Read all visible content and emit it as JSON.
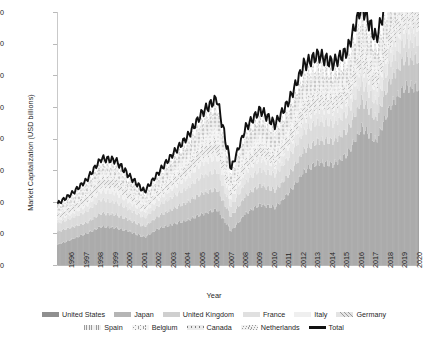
{
  "chart_data": {
    "type": "area",
    "title": "",
    "xlabel": "Year",
    "ylabel": "Market Capitalization (USD billions)",
    "ylim": [
      0,
      40000
    ],
    "ytick_labels": [
      "40,000",
      "35,000",
      "30,000",
      "25,000",
      "20,000",
      "15,000",
      "10,000",
      "5,000",
      "0"
    ],
    "ytick_values": [
      40000,
      35000,
      30000,
      25000,
      20000,
      15000,
      10000,
      5000,
      0
    ],
    "grid": false,
    "legend_position": "bottom",
    "categories": [
      "1996",
      "1997",
      "1998",
      "1999",
      "2000",
      "2001",
      "2002",
      "2003",
      "2004",
      "2005",
      "2006",
      "2007",
      "2008",
      "2009",
      "2010",
      "2011",
      "2012",
      "2013",
      "2014",
      "2015",
      "2016",
      "2017",
      "2018",
      "2019",
      "2020"
    ],
    "stacked": true,
    "series": [
      {
        "name": "United States",
        "fill": "#9d9d9d",
        "pattern": "vertical-lines",
        "values": [
          3200,
          4100,
          5000,
          6100,
          5900,
          5300,
          4400,
          5800,
          6500,
          7100,
          8100,
          8800,
          5400,
          8200,
          9600,
          9100,
          11500,
          14800,
          16300,
          15900,
          17500,
          21800,
          19600,
          25300,
          28200
        ]
      },
      {
        "name": "Japan",
        "fill": "#bdbdbd",
        "pattern": "solid",
        "values": [
          2100,
          1900,
          1700,
          2100,
          2100,
          1800,
          1700,
          2000,
          2400,
          2900,
          3300,
          3200,
          2300,
          2800,
          3100,
          2700,
          2900,
          3300,
          3400,
          3700,
          3800,
          4300,
          3500,
          4200,
          4500
        ]
      },
      {
        "name": "United Kingdom",
        "fill": "#d6d6d6",
        "pattern": "solid",
        "values": [
          1300,
          1500,
          1800,
          2200,
          2000,
          1700,
          1400,
          1700,
          2000,
          2300,
          2800,
          2900,
          1600,
          2200,
          2500,
          2500,
          2800,
          3000,
          3100,
          2800,
          2700,
          2900,
          2600,
          2800,
          2800
        ]
      },
      {
        "name": "France",
        "fill": "#e3e3e3",
        "pattern": "solid",
        "values": [
          530,
          640,
          900,
          1300,
          1400,
          1100,
          900,
          1000,
          1300,
          1600,
          2000,
          2100,
          1200,
          1600,
          1700,
          1400,
          1600,
          1900,
          2000,
          2000,
          1900,
          2300,
          2100,
          2300,
          2300
        ]
      },
      {
        "name": "Italy",
        "fill": "#efefef",
        "pattern": "solid",
        "values": [
          250,
          330,
          550,
          700,
          800,
          500,
          400,
          500,
          600,
          700,
          900,
          900,
          500,
          600,
          600,
          400,
          500,
          600,
          600,
          500,
          500,
          600,
          500,
          600,
          600
        ]
      },
      {
        "name": "Germany",
        "fill": "#e8e8e8",
        "pattern": "hatch",
        "values": [
          600,
          800,
          1000,
          1400,
          1300,
          1000,
          600,
          800,
          1000,
          1200,
          1600,
          1800,
          1000,
          1300,
          1400,
          1200,
          1400,
          1900,
          1700,
          1700,
          1700,
          2200,
          1800,
          2000,
          2200
        ]
      },
      {
        "name": "Spain",
        "fill": "#f2f2f2",
        "pattern": "dots",
        "values": [
          200,
          280,
          400,
          500,
          500,
          470,
          450,
          600,
          900,
          1000,
          1300,
          1800,
          900,
          1300,
          1200,
          1000,
          1000,
          1100,
          1000,
          800,
          800,
          900,
          700,
          800,
          700
        ]
      },
      {
        "name": "Belgium",
        "fill": "#f6f6f6",
        "pattern": "circles",
        "values": [
          120,
          140,
          250,
          200,
          200,
          160,
          130,
          180,
          250,
          300,
          400,
          400,
          200,
          300,
          300,
          230,
          300,
          350,
          400,
          400,
          400,
          450,
          350,
          400,
          400
        ]
      },
      {
        "name": "Canada",
        "fill": "#ededed",
        "pattern": "plus",
        "values": [
          490,
          560,
          540,
          750,
          800,
          700,
          600,
          900,
          1200,
          1500,
          1700,
          2200,
          1000,
          1700,
          2200,
          1900,
          2000,
          2100,
          2100,
          1600,
          2000,
          2400,
          1900,
          2400,
          2600
        ]
      },
      {
        "name": "Netherlands",
        "fill": "#f4f4f4",
        "pattern": "zigzag",
        "values": [
          380,
          470,
          600,
          700,
          700,
          500,
          400,
          500,
          600,
          700,
          800,
          900,
          400,
          600,
          700,
          600,
          700,
          900,
          900,
          800,
          800,
          1100,
          800,
          1000,
          1100
        ]
      }
    ],
    "total_line": {
      "name": "Total",
      "color": "#111111",
      "values": [
        9170,
        10720,
        12740,
        15950,
        15700,
        13230,
        11000,
        13980,
        16750,
        19300,
        22900,
        25000,
        14500,
        20600,
        23300,
        21030,
        24700,
        29950,
        31500,
        30200,
        32100,
        38950,
        33850,
        41800,
        45400
      ]
    },
    "total_line_note": "Black 'Total' line plotted on top of stacked columns; monthly resolution, peaks near 35,500 at 2020."
  },
  "axis": {
    "x_title": "Year",
    "y_title": "Market Capitalization (USD billions)"
  },
  "legend": {
    "rows": [
      [
        {
          "label": "United States",
          "swatch": "dark-gray-block"
        },
        {
          "label": "Japan",
          "swatch": "medium-gray-block"
        },
        {
          "label": "United Kingdom",
          "swatch": "light-gray-block"
        },
        {
          "label": "France",
          "swatch": "lighter-gray-block"
        },
        {
          "label": "Italy",
          "swatch": "very-light-gray-block"
        },
        {
          "label": "Germany",
          "swatch": "hatched-block"
        }
      ],
      [
        {
          "label": "Spain",
          "swatch": "dotted-block"
        },
        {
          "label": "Belgium",
          "swatch": "circles-block"
        },
        {
          "label": "Canada",
          "swatch": "plus-marks-block"
        },
        {
          "label": "Netherlands",
          "swatch": "zigzag-block"
        },
        {
          "label": "Total",
          "swatch": "black-line"
        }
      ]
    ]
  },
  "colors": {
    "background": "#ffffff",
    "text": "#1f1f1f",
    "axis": "#b9b9b9",
    "total_line": "#111111"
  }
}
